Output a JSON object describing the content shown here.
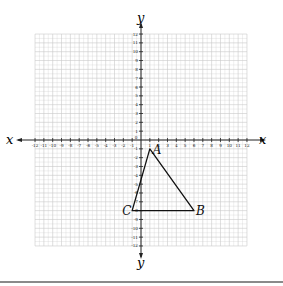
{
  "chart_data": {
    "type": "scatter",
    "title": "",
    "xlabel": "x",
    "ylabel": "y",
    "xlim": [
      -12,
      12
    ],
    "ylim": [
      -12,
      12
    ],
    "grid": true,
    "x_ticks": [
      -12,
      -11,
      -10,
      -9,
      -8,
      -7,
      -6,
      -5,
      -4,
      -3,
      -2,
      -1,
      1,
      2,
      3,
      4,
      5,
      6,
      7,
      8,
      9,
      10,
      11,
      12
    ],
    "y_ticks": [
      -12,
      -11,
      -10,
      -9,
      -8,
      -7,
      -6,
      -5,
      -4,
      -3,
      -2,
      -1,
      1,
      2,
      3,
      4,
      5,
      6,
      7,
      8,
      9,
      10,
      11,
      12
    ],
    "origin_label": "0",
    "polygon": {
      "name": "triangle ABC",
      "vertices": [
        {
          "label": "A",
          "x": 1,
          "y": -1
        },
        {
          "label": "B",
          "x": 6,
          "y": -8
        },
        {
          "label": "C",
          "x": -1,
          "y": -8
        }
      ]
    }
  },
  "axes": {
    "x_label_left": "x",
    "x_label_right": "x",
    "y_label_top": "y",
    "y_label_bottom": "y"
  },
  "colors": {
    "grid": "#c9c9c9",
    "axis": "#222222",
    "triangle": "#111111",
    "text": "#222222",
    "rule": "#8a8a8a"
  }
}
